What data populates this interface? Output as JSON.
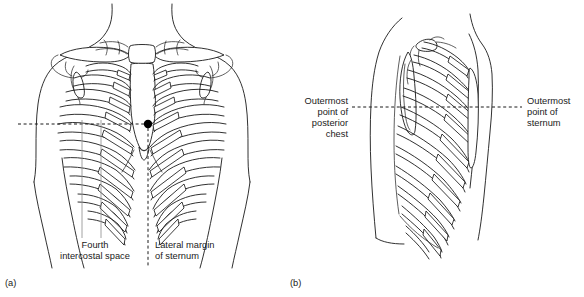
{
  "figure": {
    "title_visible": false,
    "background_color": "#ffffff",
    "line_color": "#1a1a1a",
    "marker_color": "#000000",
    "leader_color": "#8a8a8a"
  },
  "panels": [
    {
      "id": "a",
      "caption": "(a)",
      "view": "anterior-chest",
      "labels": [
        {
          "name": "fourth-intercostal-space",
          "lines": [
            "Fourth",
            "intercostal space"
          ],
          "align": "center",
          "x": 95,
          "y": 248
        },
        {
          "name": "lateral-margin-of-sternum",
          "lines": [
            "Lateral margin",
            "of sternum"
          ],
          "align": "left",
          "x": 155,
          "y": 248
        }
      ],
      "markers": [
        {
          "name": "intercostal-point-marker",
          "x": 148,
          "y": 124,
          "r": 4.2
        }
      ],
      "guides": [
        {
          "name": "horizontal-dashed-guide",
          "x1": 18,
          "y1": 124,
          "x2": 145,
          "y2": 124
        },
        {
          "name": "vertical-dashed-guide",
          "x1": 148,
          "y1": 128,
          "x2": 148,
          "y2": 268
        }
      ]
    },
    {
      "id": "b",
      "caption": "(b)",
      "view": "lateral-chest",
      "labels": [
        {
          "name": "outermost-point-of-posterior-chest",
          "lines": [
            "Outermost",
            "point of",
            "posterior",
            "chest"
          ],
          "align": "right",
          "x": 348,
          "y": 104
        },
        {
          "name": "outermost-point-of-sternum",
          "lines": [
            "Outermost",
            "point of",
            "sternum"
          ],
          "align": "left",
          "x": 527,
          "y": 104
        }
      ],
      "guides": [
        {
          "name": "horizontal-dashed-guide",
          "x1": 352,
          "y1": 107,
          "x2": 522,
          "y2": 107
        }
      ]
    }
  ]
}
